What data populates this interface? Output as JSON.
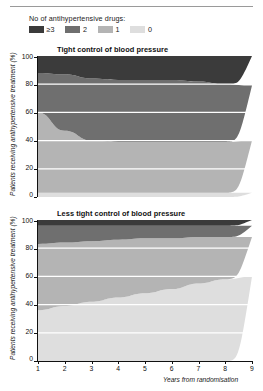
{
  "legend": {
    "title": "No of antihypertensive drugs:",
    "items": [
      {
        "label": "≥3",
        "color": "#3b3b3b",
        "key": "ge3"
      },
      {
        "label": "2",
        "color": "#6f6f6f",
        "key": "two"
      },
      {
        "label": "1",
        "color": "#b4b4b4",
        "key": "one"
      },
      {
        "label": "0",
        "color": "#dedede",
        "key": "zero"
      }
    ]
  },
  "axis": {
    "ylabel": "Patients receiving antihypertensive treatment (%)",
    "yticks": [
      "100",
      "80",
      "60",
      "40",
      "20",
      "0"
    ],
    "xlabel": "Years from randomisation",
    "xticks": [
      "1",
      "2",
      "3",
      "4",
      "5",
      "6",
      "7",
      "8",
      "9"
    ]
  },
  "chart_data": {
    "type": "area",
    "xlabel": "Years from randomisation",
    "ylabel": "Patients receiving antihypertensive treatment (%)",
    "xlim": [
      1,
      9
    ],
    "ylim": [
      0,
      100
    ],
    "grid": false,
    "stacked": true,
    "legend_position": "top-left",
    "legend_title": "No of antihypertensive drugs:",
    "x": [
      1,
      2,
      3,
      4,
      5,
      6,
      7,
      8,
      9
    ],
    "panels": [
      {
        "title": "Tight control of blood pressure",
        "series": [
          {
            "name": "0",
            "color": "#dedede",
            "values": [
              3,
              3,
              3,
              3,
              3,
              3,
              3,
              3,
              3
            ]
          },
          {
            "name": "1",
            "color": "#b4b4b4",
            "values": [
              57,
              44,
              37,
              36,
              36,
              36,
              36,
              36,
              37
            ]
          },
          {
            "name": "2",
            "color": "#6f6f6f",
            "values": [
              28,
              40,
              44,
              44,
              44,
              44,
              43,
              41,
              39
            ]
          },
          {
            "name": "≥3",
            "color": "#3b3b3b",
            "values": [
              12,
              13,
              16,
              17,
              17,
              17,
              18,
              20,
              21
            ]
          }
        ]
      },
      {
        "title": "Less tight control of blood pressure",
        "series": [
          {
            "name": "0",
            "color": "#dedede",
            "values": [
              36,
              39,
              42,
              45,
              48,
              51,
              55,
              58,
              60
            ]
          },
          {
            "name": "1",
            "color": "#b4b4b4",
            "values": [
              47,
              45,
              43,
              41,
              39,
              36,
              33,
              30,
              28
            ]
          },
          {
            "name": "2",
            "color": "#6f6f6f",
            "values": [
              13,
              12,
              11,
              10,
              9,
              9,
              8,
              8,
              8
            ]
          },
          {
            "name": "≥3",
            "color": "#3b3b3b",
            "values": [
              4,
              4,
              4,
              4,
              4,
              4,
              4,
              4,
              4
            ]
          }
        ]
      }
    ]
  }
}
